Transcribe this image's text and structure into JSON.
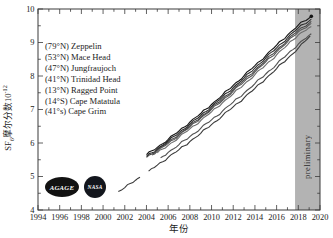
{
  "chart_data": {
    "type": "line",
    "title": "",
    "xlabel": "年份",
    "ylabel": "SF₆摩尔分数10⁻¹²",
    "ylabel_parts": {
      "pre": "SF",
      "sub": "6",
      "mid": "摩尔分数10",
      "sup": "-12"
    },
    "xlim": [
      1994,
      2020
    ],
    "ylim": [
      4,
      10
    ],
    "grid": false,
    "legend_position": "upper-left-inside",
    "axis_color": "#3a3a3a",
    "tick_label_color": "#1c1c1c",
    "x_major_ticks": [
      1994,
      1996,
      1998,
      2000,
      2002,
      2004,
      2006,
      2008,
      2010,
      2012,
      2014,
      2016,
      2018,
      2020
    ],
    "x_minor_ticks": [
      1995,
      1997,
      1999,
      2001,
      2003,
      2005,
      2007,
      2009,
      2011,
      2013,
      2015,
      2017,
      2019
    ],
    "y_major_ticks": [
      4,
      5,
      6,
      7,
      8,
      9,
      10
    ],
    "y_minor_ticks": [
      4.5,
      5.5,
      6.5,
      7.5,
      8.5,
      9.5
    ],
    "preliminary_band": {
      "label": "preliminary",
      "x_start": 2017.7,
      "x_end": 2020,
      "color": "#b3b3b3"
    },
    "series": [
      {
        "label": "(79°N) Zeppelin",
        "color": "#161616",
        "phase": 0.0,
        "end_marker": true,
        "x": [
          2004,
          2005,
          2006,
          2007,
          2008,
          2009,
          2010,
          2011,
          2012,
          2013,
          2014,
          2015,
          2016,
          2017,
          2018,
          2019.2
        ],
        "y": [
          5.65,
          5.87,
          6.11,
          6.36,
          6.62,
          6.88,
          7.15,
          7.43,
          7.72,
          8.01,
          8.31,
          8.61,
          8.92,
          9.22,
          9.52,
          9.78
        ]
      },
      {
        "label": "(53°N) Mace Head",
        "color": "#2e2e2e",
        "phase": 0.9,
        "end_marker": false,
        "x": [
          2004,
          2005,
          2006,
          2007,
          2008,
          2009,
          2010,
          2011,
          2012,
          2013,
          2014,
          2015,
          2016,
          2017,
          2018,
          2019.2
        ],
        "y": [
          5.6,
          5.82,
          6.06,
          6.31,
          6.56,
          6.82,
          7.09,
          7.37,
          7.65,
          7.94,
          8.24,
          8.54,
          8.84,
          9.14,
          9.44,
          9.7
        ]
      },
      {
        "label": "(47°N) Jungfraujoch",
        "color": "#474747",
        "phase": 1.8,
        "end_marker": false,
        "x": [
          2004,
          2005,
          2006,
          2007,
          2008,
          2009,
          2010,
          2011,
          2012,
          2013,
          2014,
          2015,
          2016,
          2017,
          2018,
          2019.2
        ],
        "y": [
          5.57,
          5.79,
          6.02,
          6.26,
          6.51,
          6.77,
          7.04,
          7.31,
          7.59,
          7.88,
          8.17,
          8.47,
          8.77,
          9.07,
          9.37,
          9.63
        ]
      },
      {
        "label": "(41°N) Trinidad Head",
        "color": "#5a5a5a",
        "phase": 2.7,
        "end_marker": false,
        "x": [
          2004.5,
          2005,
          2006,
          2007,
          2008,
          2009,
          2010,
          2011,
          2012,
          2013,
          2014,
          2015,
          2016,
          2017,
          2018,
          2019.2
        ],
        "y": [
          5.64,
          5.75,
          5.99,
          6.23,
          6.48,
          6.74,
          7.0,
          7.27,
          7.55,
          7.83,
          8.12,
          8.42,
          8.72,
          9.02,
          9.32,
          9.57
        ]
      },
      {
        "label": "(13°N) Ragged Point",
        "color": "#6e6e6e",
        "phase": 3.6,
        "end_marker": false,
        "x": [
          2005,
          2006,
          2007,
          2008,
          2009,
          2010,
          2011,
          2012,
          2013,
          2014,
          2015,
          2016,
          2017,
          2018,
          2019.2
        ],
        "y": [
          5.7,
          5.93,
          6.17,
          6.42,
          6.67,
          6.93,
          7.2,
          7.47,
          7.75,
          8.04,
          8.33,
          8.63,
          8.93,
          9.23,
          9.48
        ]
      },
      {
        "label": "(14°S) Cape Matatula",
        "color": "#525252",
        "phase": 4.5,
        "end_marker": false,
        "x": [
          2005.3,
          2006,
          2007,
          2008,
          2009,
          2010,
          2011,
          2012,
          2013,
          2014,
          2015,
          2016,
          2017,
          2018,
          2019.2
        ],
        "y": [
          5.56,
          5.72,
          5.95,
          6.19,
          6.44,
          6.69,
          6.95,
          7.22,
          7.49,
          7.77,
          8.06,
          8.35,
          8.65,
          8.95,
          9.26
        ]
      },
      {
        "label": "(41°s) Cape Grim",
        "color": "#3a3a3a",
        "phase": 5.4,
        "end_marker": false,
        "x": [
          2001.4,
          2002,
          2003,
          2003.4,
          2003.8,
          2004.2,
          2005,
          2006,
          2007,
          2008,
          2009,
          2010,
          2011,
          2012,
          2013,
          2014,
          2015,
          2016,
          2017,
          2018,
          2019.1
        ],
        "y": [
          4.55,
          4.67,
          4.89,
          4.98,
          null,
          5.16,
          5.34,
          5.57,
          5.8,
          6.04,
          6.29,
          6.55,
          6.81,
          7.08,
          7.35,
          7.63,
          7.92,
          8.22,
          8.52,
          8.83,
          9.2
        ]
      }
    ]
  },
  "logos": {
    "agage": "AGAGE",
    "nasa": "NASA"
  }
}
